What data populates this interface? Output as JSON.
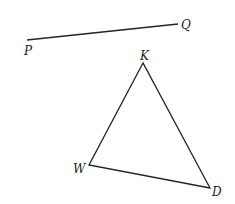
{
  "diagram": {
    "segment": {
      "start_label": "P",
      "end_label": "Q"
    },
    "triangle": {
      "vertices": [
        "K",
        "W",
        "D"
      ]
    },
    "colors": {
      "stroke": "#222222",
      "background": "#ffffff"
    }
  }
}
